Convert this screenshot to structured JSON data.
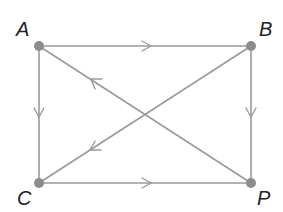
{
  "diagram": {
    "type": "directed-graph",
    "colors": {
      "edge": "#9a9a9a",
      "vertex": "#8c8c8c",
      "label": "#222222"
    },
    "vertices": [
      {
        "id": "A",
        "label": "A",
        "x": 39,
        "y": 46,
        "label_x": 16,
        "label_y": 36
      },
      {
        "id": "B",
        "label": "B",
        "x": 251,
        "y": 46,
        "label_x": 259,
        "label_y": 36
      },
      {
        "id": "C",
        "label": "C",
        "x": 39,
        "y": 183,
        "label_x": 17,
        "label_y": 205
      },
      {
        "id": "P",
        "label": "P",
        "x": 251,
        "y": 183,
        "label_x": 257,
        "label_y": 205
      }
    ],
    "edges": [
      {
        "from": "A",
        "to": "B"
      },
      {
        "from": "A",
        "to": "C"
      },
      {
        "from": "B",
        "to": "P"
      },
      {
        "from": "C",
        "to": "P"
      },
      {
        "from": "P",
        "to": "A"
      },
      {
        "from": "B",
        "to": "C"
      }
    ]
  }
}
